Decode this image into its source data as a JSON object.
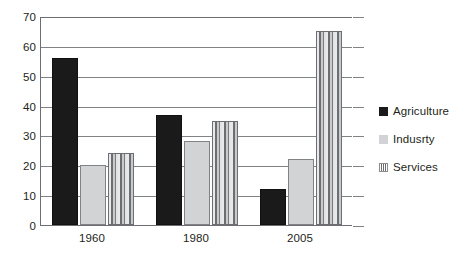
{
  "chart_data": {
    "type": "bar",
    "title": "",
    "subtitle": "",
    "xlabel": "",
    "ylabel": "",
    "categories": [
      "1960",
      "1980",
      "2005"
    ],
    "series": [
      {
        "name": "Agriculture",
        "values": [
          56,
          37,
          12
        ],
        "color": "#1a1a1a",
        "pattern": "solid-dark"
      },
      {
        "name": "Indusrty",
        "values": [
          20,
          28,
          22
        ],
        "color": "#d2d3d5",
        "pattern": "solid-light-gray"
      },
      {
        "name": "Services",
        "values": [
          24,
          35,
          65
        ],
        "color": "#d9dadb",
        "pattern": "vertical-stripes"
      }
    ],
    "ylim": [
      0,
      70
    ],
    "ytick_step": 10,
    "yticks": [
      0,
      10,
      20,
      30,
      40,
      50,
      60,
      70
    ],
    "ytick_labels": [
      "0",
      "10",
      "20",
      "30",
      "40",
      "50",
      "60",
      "70"
    ],
    "grid": true,
    "grid_axis": "y",
    "legend": true,
    "legend_position": "right",
    "legend_entries": [
      "Agriculture",
      "Indusrty",
      "Services"
    ],
    "background_color": "#ffffff",
    "axis_color": "#6d6e71",
    "gridline_color": "#808285"
  }
}
